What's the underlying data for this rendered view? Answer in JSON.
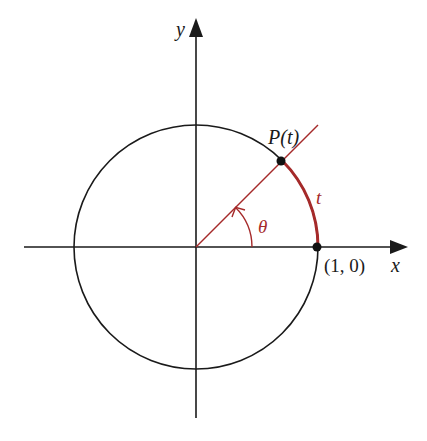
{
  "diagram": {
    "labels": {
      "x_axis": "x",
      "y_axis": "y",
      "point": "P(t)",
      "arc": "t",
      "angle": "θ",
      "start_point": "(1, 0)"
    },
    "colors": {
      "ink": "#1a1a1a",
      "accent": "#a52a2a",
      "background": "#ffffff"
    },
    "geometry": {
      "center": [
        196,
        247
      ],
      "radius": 122,
      "angle_degrees": 45
    }
  }
}
